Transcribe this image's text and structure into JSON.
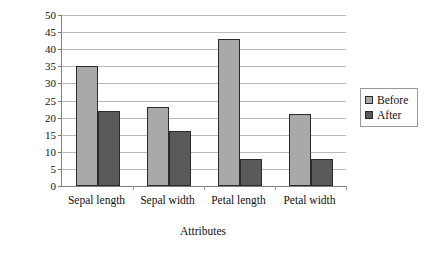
{
  "chart_data": {
    "type": "bar",
    "title": "",
    "xlabel": "Attributes",
    "ylabel": "Number of class",
    "categories": [
      "Sepal length",
      "Sepal width",
      "Petal length",
      "Petal width"
    ],
    "series": [
      {
        "name": "Before",
        "color": "#a9a9a9",
        "values": [
          35,
          23,
          43,
          21
        ]
      },
      {
        "name": "After",
        "color": "#5a5a5a",
        "values": [
          22,
          16,
          8,
          8
        ]
      }
    ],
    "ylim": [
      0,
      50
    ],
    "ytick_step": 5,
    "yticks": [
      0,
      5,
      10,
      15,
      20,
      25,
      30,
      35,
      40,
      45,
      50
    ],
    "grid": true,
    "legend_position": "right",
    "legend_entries": [
      "Before",
      "After"
    ]
  }
}
